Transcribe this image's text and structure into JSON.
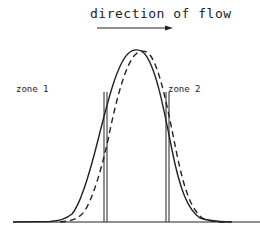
{
  "diagram": {
    "title": "direction of flow",
    "arrow": {
      "direction": "right"
    },
    "zones": [
      {
        "label": "zone 1"
      },
      {
        "label": "zone 2"
      }
    ],
    "curves": [
      {
        "name": "solid-peak",
        "style": "solid"
      },
      {
        "name": "dashed-peak",
        "style": "dashed"
      }
    ],
    "colors": {
      "line": "#222222",
      "background": "#ffffff"
    }
  }
}
